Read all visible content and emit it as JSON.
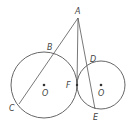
{
  "diagram": {
    "points": {
      "A": {
        "label": "A",
        "x": 78,
        "y": 18,
        "lx": 75,
        "ly": 14
      },
      "B": {
        "label": "B",
        "x": 52,
        "y": 54,
        "lx": 47,
        "ly": 50
      },
      "C": {
        "label": "C",
        "x": 19,
        "y": 104,
        "lx": 9,
        "ly": 111
      },
      "D": {
        "label": "D",
        "x": 89,
        "y": 67,
        "lx": 90,
        "ly": 62
      },
      "E": {
        "label": "E",
        "x": 95,
        "y": 109,
        "lx": 93,
        "ly": 120
      },
      "F": {
        "label": "F",
        "x": 77,
        "y": 85,
        "lx": 66,
        "ly": 88
      },
      "O1": {
        "label": "O",
        "x": 44,
        "y": 85,
        "lx": 42,
        "ly": 96
      },
      "O2": {
        "label": "O",
        "x": 101,
        "y": 85,
        "lx": 98,
        "ly": 96
      }
    },
    "circles": [
      {
        "name": "circle-O-large",
        "cx": 44,
        "cy": 85,
        "r": 33
      },
      {
        "name": "circle-O-small",
        "cx": 101,
        "cy": 85,
        "r": 24
      }
    ],
    "segments": [
      {
        "name": "secant-AC",
        "from": "A",
        "to": "C"
      },
      {
        "name": "tangent-AF",
        "from": "A",
        "to": "F"
      },
      {
        "name": "secant-AE",
        "from": "A",
        "to": "E"
      }
    ],
    "stroke_color": "#555555"
  }
}
